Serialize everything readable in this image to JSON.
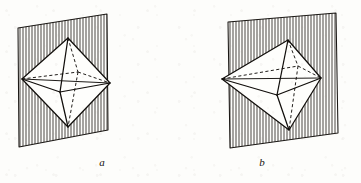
{
  "figure": {
    "caption_a": "a",
    "caption_b": "b",
    "background_color": "#fdfdfb",
    "ink_color": "#120f0c",
    "hatch_color": "#2a2622"
  },
  "panels": [
    {
      "id": "panel-a",
      "label": "a",
      "label_x": 102,
      "label_y": 166,
      "plane": {
        "name": "diagonal-mirror-plane",
        "corners": [
          [
            18,
            28
          ],
          [
            107,
            14
          ],
          [
            108,
            130
          ],
          [
            19,
            147
          ]
        ],
        "hatch_direction": "vertical",
        "hatch_count": 31
      },
      "octahedron": {
        "vertices": {
          "top": [
            68,
            38
          ],
          "bottom": [
            68,
            127
          ],
          "left": [
            22,
            79
          ],
          "right": [
            110,
            83
          ],
          "front": [
            60,
            92
          ],
          "back": [
            78,
            72
          ]
        }
      }
    },
    {
      "id": "panel-b",
      "label": "b",
      "label_x": 262,
      "label_y": 166,
      "plane": {
        "name": "diagonal-mirror-plane",
        "corners": [
          [
            228,
            22
          ],
          [
            336,
            13
          ],
          [
            338,
            133
          ],
          [
            230,
            148
          ]
        ],
        "hatch_direction": "vertical",
        "hatch_count": 37
      },
      "octahedron": {
        "vertices": {
          "top": [
            288,
            40
          ],
          "bottom": [
            289,
            130
          ],
          "left": [
            222,
            79
          ],
          "right": [
            321,
            78
          ],
          "front": [
            277,
            95
          ],
          "back": [
            298,
            66
          ]
        }
      }
    }
  ]
}
